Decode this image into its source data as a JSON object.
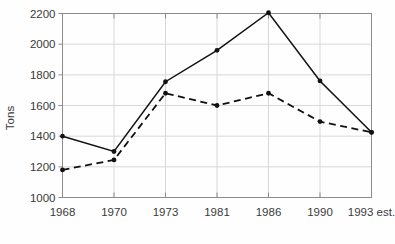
{
  "chart_data": {
    "type": "line",
    "title": "",
    "xlabel": "",
    "ylabel": "Tons",
    "categories": [
      "1968",
      "1970",
      "1973",
      "1981",
      "1986",
      "1990",
      "1993 est."
    ],
    "ylim": [
      1000,
      2200
    ],
    "yticks": [
      1000,
      1200,
      1400,
      1600,
      1800,
      2000,
      2200
    ],
    "ytick_labels": [
      "1000",
      "1200",
      "1400",
      "1600",
      "1800",
      "2000",
      "2200"
    ],
    "grid": true,
    "legend": "none",
    "series": [
      {
        "name": "solid",
        "style": "solid",
        "color": "#111111",
        "marker": "filled-circle",
        "values": [
          1400,
          1300,
          1755,
          1960,
          2205,
          1760,
          1425
        ]
      },
      {
        "name": "dashed",
        "style": "dashed",
        "color": "#111111",
        "marker": "filled-circle",
        "values": [
          1180,
          1245,
          1680,
          1600,
          1680,
          1495,
          1425
        ]
      }
    ]
  },
  "axis": {
    "y_label": "Tons"
  }
}
